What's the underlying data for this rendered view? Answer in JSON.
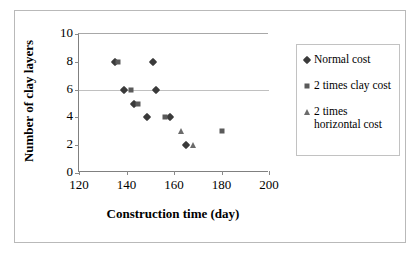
{
  "chart_data": {
    "type": "scatter",
    "title": "",
    "xlabel": "Construction time (day)",
    "ylabel": "Number of clay layers",
    "xlim": [
      120,
      200
    ],
    "ylim": [
      0,
      10
    ],
    "xticks": [
      120,
      140,
      160,
      180,
      200
    ],
    "yticks": [
      0,
      2,
      4,
      6,
      8,
      10
    ],
    "grid": "horizontal",
    "legend_position": "right",
    "series": [
      {
        "name": "Normal cost",
        "marker": "diamond",
        "color": "#3a3a3a",
        "points": [
          {
            "x": 135,
            "y": 8
          },
          {
            "x": 151,
            "y": 8
          },
          {
            "x": 139,
            "y": 6
          },
          {
            "x": 152.5,
            "y": 6
          },
          {
            "x": 143,
            "y": 5
          },
          {
            "x": 148.5,
            "y": 4
          },
          {
            "x": 158.5,
            "y": 4
          },
          {
            "x": 165,
            "y": 2
          }
        ]
      },
      {
        "name": "2 times clay cost",
        "marker": "square",
        "color": "#5a5a5a",
        "points": [
          {
            "x": 136.5,
            "y": 8
          },
          {
            "x": 142,
            "y": 6
          },
          {
            "x": 145,
            "y": 5
          },
          {
            "x": 156,
            "y": 4
          },
          {
            "x": 180,
            "y": 3
          }
        ]
      },
      {
        "name": "2 times horizontal cost",
        "marker": "triangle",
        "color": "#6b6b6b",
        "points": [
          {
            "x": 163,
            "y": 3
          },
          {
            "x": 168,
            "y": 2
          }
        ]
      }
    ]
  },
  "legend": {
    "items": [
      {
        "label": "Normal cost",
        "marker": "diamond"
      },
      {
        "label": "2 times clay cost",
        "marker": "square"
      },
      {
        "label": "2 times horizontal cost",
        "marker": "triangle"
      }
    ]
  }
}
